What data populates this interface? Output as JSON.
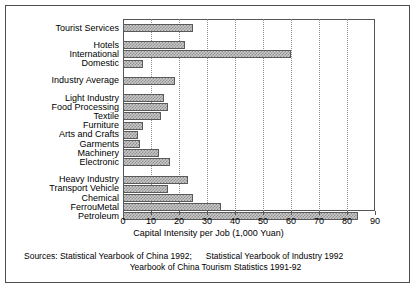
{
  "chart_data": {
    "type": "bar",
    "orientation": "horizontal",
    "title": "",
    "xlabel": "Capital Intensity per Job (1,000 Yuan)",
    "ylabel": "",
    "xlim": [
      0,
      90
    ],
    "xticks": [
      0,
      10,
      20,
      30,
      40,
      50,
      60,
      70,
      80,
      90
    ],
    "grid": "vertical-dotted",
    "legend": "none",
    "bar_fill": "#c9c9c9",
    "bar_edge": "#5a5a5a",
    "categories": [
      "Tourist Services",
      "Hotels",
      "International",
      "Domestic",
      "Industry Average",
      "Light Industry",
      "Food Processing",
      "Textile",
      "Furniture",
      "Arts and Crafts",
      "Garments",
      "Machinery",
      "Electronic",
      "Heavy Industry",
      "Transport Vehicle",
      "Chemical",
      "FerrouMetal",
      "Petroleum"
    ],
    "values": [
      25,
      22,
      60,
      7,
      18.5,
      14.7,
      16,
      13.7,
      7,
      5.4,
      6,
      13,
      16.7,
      23.3,
      16.1,
      24.9,
      34.9,
      84
    ],
    "groups": [
      {
        "label": "Tourist Services",
        "members": [
          "Tourist Services"
        ]
      },
      {
        "label": "Tourism Detail",
        "members": [
          "Hotels",
          "International",
          "Domestic"
        ]
      },
      {
        "label": "Industry Average",
        "members": [
          "Industry Average"
        ]
      },
      {
        "label": "Light Industry Group",
        "members": [
          "Light Industry",
          "Food Processing",
          "Textile",
          "Furniture",
          "Arts and Crafts",
          "Garments",
          "Machinery",
          "Electronic"
        ]
      },
      {
        "label": "Heavy Industry Group",
        "members": [
          "Heavy Industry",
          "Transport Vehicle",
          "Chemical",
          "FerrouMetal",
          "Petroleum"
        ]
      }
    ]
  },
  "sources": {
    "line1_a": "Sources: Statistical Yearbook of China 1992;",
    "line1_b": "Statistical Yearbook of Industry 1992",
    "line2": "Yearbook of China Tourism Statistics 1991-92"
  }
}
